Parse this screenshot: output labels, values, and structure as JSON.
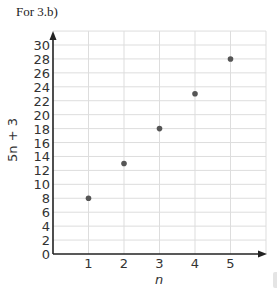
{
  "title": "For 3.b)",
  "chart_data": {
    "type": "scatter",
    "title": "For 3.b)",
    "xlabel": "n",
    "ylabel": "5n + 3",
    "x": [
      1,
      2,
      3,
      4,
      5
    ],
    "values": [
      8,
      13,
      18,
      23,
      28
    ],
    "xticks": [
      "1",
      "2",
      "3",
      "4",
      "5"
    ],
    "yticks": [
      "0",
      "2",
      "4",
      "6",
      "8",
      "10",
      "12",
      "14",
      "16",
      "18",
      "20",
      "22",
      "24",
      "26",
      "28",
      "30"
    ],
    "xlim": [
      0,
      6
    ],
    "ylim": [
      0,
      32
    ],
    "grid": true,
    "legend": null,
    "colors": {
      "point": "#555555",
      "grid": "#dddddd",
      "axis": "#222222"
    }
  }
}
